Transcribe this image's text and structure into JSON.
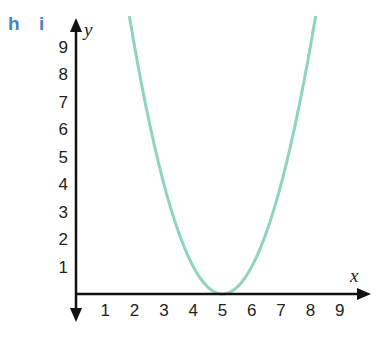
{
  "panel_labels": [
    "h",
    "i"
  ],
  "colors": {
    "curve": "#8fd3c0",
    "axis": "#111111",
    "panel_label": "#4a7fc1"
  },
  "chart_data": {
    "type": "line",
    "title": "",
    "function": "y = (x - 5)^2",
    "xlabel": "x",
    "ylabel": "y",
    "x_ticks": [
      "1",
      "2",
      "3",
      "4",
      "5",
      "6",
      "7",
      "8",
      "9"
    ],
    "y_ticks": [
      "1",
      "2",
      "3",
      "4",
      "5",
      "6",
      "7",
      "8",
      "9"
    ],
    "xlim": [
      0,
      10
    ],
    "ylim": [
      0,
      10
    ],
    "grid": false,
    "series": [
      {
        "name": "parabola",
        "x": [
          1.8,
          2,
          3,
          4,
          5,
          6,
          7,
          8,
          8.2
        ],
        "y": [
          10.24,
          9,
          4,
          1,
          0,
          1,
          4,
          9,
          10.24
        ]
      }
    ]
  }
}
